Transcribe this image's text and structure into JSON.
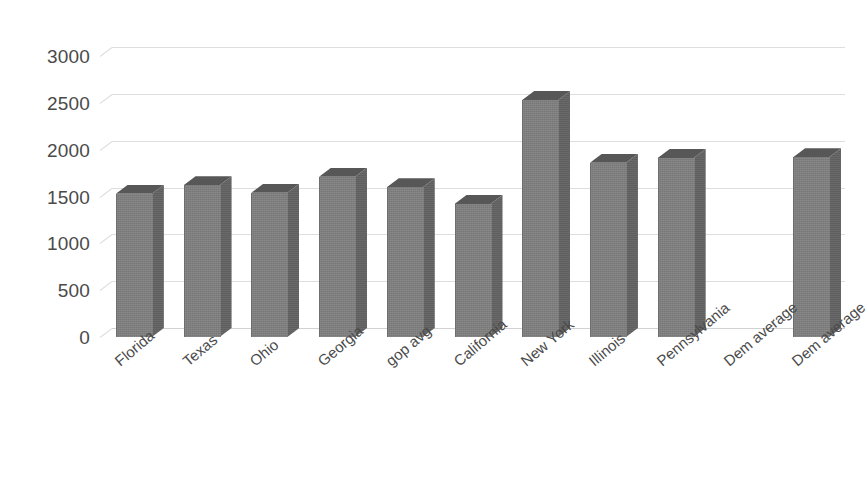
{
  "chart_data": {
    "type": "bar",
    "title": "",
    "xlabel": "",
    "ylabel": "",
    "categories": [
      "Florida",
      "Texas",
      "Ohio",
      "Georgia",
      "gop avg",
      "California",
      "New York",
      "Illinois",
      "Pennsylvania",
      "Dem average",
      "Dem average"
    ],
    "values": [
      1530,
      1620,
      1540,
      1710,
      1600,
      1420,
      2530,
      1860,
      1910,
      null,
      1920
    ],
    "ylim": [
      0,
      3000
    ],
    "yticks": [
      0,
      500,
      1000,
      1500,
      2000,
      2500,
      3000
    ],
    "ytick_labels": [
      "0",
      "500",
      "1000",
      "1500",
      "2000",
      "2500",
      "3000"
    ],
    "grid": true,
    "legend": "none",
    "style": "3d-column",
    "series": [
      {
        "name": "",
        "values": [
          1530,
          1620,
          1540,
          1710,
          1600,
          1420,
          2530,
          1860,
          1910,
          null,
          1920
        ]
      }
    ],
    "colors": {
      "bar_face": "#7f7f7f",
      "bar_side": "#636363",
      "bar_top": "#575757",
      "gridline": "#dedede",
      "tick_text": "#4a4a4a",
      "background": "#ffffff"
    }
  }
}
